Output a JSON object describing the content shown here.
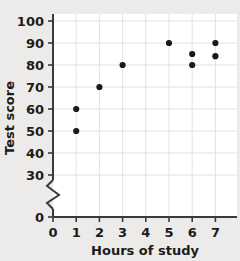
{
  "chart_data": {
    "type": "scatter",
    "title": "",
    "xlabel": "Hours of study",
    "ylabel": "Test score",
    "xlim": [
      0,
      7.6
    ],
    "ylim": [
      0,
      105
    ],
    "grid": true,
    "legend": "none",
    "y_axis_break": true,
    "y_axis_break_note": "zigzag break between 0 and 30",
    "xticks": [
      0,
      1,
      2,
      3,
      4,
      5,
      6,
      7
    ],
    "xtick_labels": [
      "0",
      "1",
      "2",
      "3",
      "4",
      "5",
      "6",
      "7"
    ],
    "yticks": [
      0,
      30,
      40,
      50,
      60,
      70,
      80,
      90,
      100
    ],
    "ytick_labels": [
      "0",
      "30",
      "40",
      "50",
      "60",
      "70",
      "80",
      "90",
      "100"
    ],
    "points": [
      {
        "x": 1,
        "y": 50
      },
      {
        "x": 1,
        "y": 60
      },
      {
        "x": 2,
        "y": 70
      },
      {
        "x": 3,
        "y": 80
      },
      {
        "x": 5,
        "y": 90
      },
      {
        "x": 6,
        "y": 80
      },
      {
        "x": 6,
        "y": 85
      },
      {
        "x": 7,
        "y": 84
      },
      {
        "x": 7,
        "y": 90
      }
    ],
    "point_color": "#1a1a1a",
    "gridline_color": "#e2e2e2",
    "axis_color": "#3a3a3a",
    "plot_background": "#ffffff",
    "page_background": "#edebe9"
  }
}
